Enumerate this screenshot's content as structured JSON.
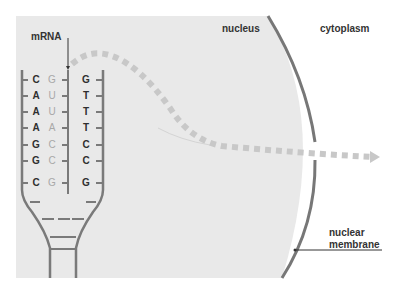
{
  "labels": {
    "mrna": "mRNA",
    "nucleus": "nucleus",
    "cytoplasm": "cytoplasm",
    "nuclear_membrane_line1": "nuclear",
    "nuclear_membrane_line2": "membrane"
  },
  "colors": {
    "nucleus_fill": "#e9e9e9",
    "membrane": "#777777",
    "strand": "#7a7a7a",
    "arrow_dots": "#c8c8c8",
    "dna_text": "#2f2f2f",
    "rna_text": "#a8a8a8"
  },
  "base_pairs": [
    {
      "template": "C",
      "mrna": "G",
      "coding": "G"
    },
    {
      "template": "A",
      "mrna": "U",
      "coding": "T"
    },
    {
      "template": "A",
      "mrna": "U",
      "coding": "T"
    },
    {
      "template": "A",
      "mrna": "A",
      "coding": "T"
    },
    {
      "template": "G",
      "mrna": "C",
      "coding": "C"
    },
    {
      "template": "G",
      "mrna": "C",
      "coding": "C"
    },
    {
      "template": "C",
      "mrna": "G",
      "coding": "G"
    }
  ]
}
